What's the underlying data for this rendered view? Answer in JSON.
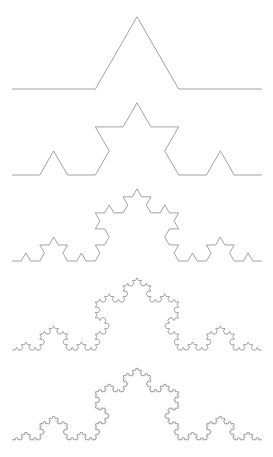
{
  "figure": {
    "background_color": "#ffffff",
    "width": 273,
    "height": 457
  },
  "chart_data": {
    "type": "line",
    "subtitle": "",
    "xlabel": "",
    "ylabel": "",
    "grid": false,
    "legend_position": "none",
    "xlim": [
      0,
      273
    ],
    "ylim": [
      457,
      0
    ],
    "axis_visible": false,
    "tick_labels_x": [],
    "tick_labels_y": [],
    "annotations": [],
    "geometry": {
      "start_x": 12,
      "end_x": 262,
      "span_width": 250,
      "peak_ratio": 0.2886751345948129
    },
    "series": [
      {
        "name": "Koch curve iteration 1",
        "order": 1,
        "depth": 1,
        "segments": 4,
        "baseline_y": 89,
        "peak_y": 17,
        "peak_x": 137,
        "stroke": "#8a8a8a",
        "stroke_width": 0.8
      },
      {
        "name": "Koch curve iteration 2",
        "order": 2,
        "depth": 2,
        "segments": 16,
        "baseline_y": 175,
        "peak_y": 103,
        "peak_x": 137,
        "stroke": "#8a8a8a",
        "stroke_width": 0.8
      },
      {
        "name": "Koch curve iteration 3",
        "order": 3,
        "depth": 3,
        "segments": 64,
        "baseline_y": 261,
        "peak_y": 189,
        "peak_x": 137,
        "stroke": "#8a8a8a",
        "stroke_width": 0.8
      },
      {
        "name": "Koch curve iteration 4",
        "order": 4,
        "depth": 4,
        "segments": 256,
        "baseline_y": 350,
        "peak_y": 278,
        "peak_x": 137,
        "stroke": "#8a8a8a",
        "stroke_width": 0.8
      },
      {
        "name": "Koch curve iteration 5",
        "order": 5,
        "depth": 5,
        "segments": 1024,
        "baseline_y": 440,
        "peak_y": 368,
        "peak_x": 137,
        "stroke": "#8a8a8a",
        "stroke_width": 0.8
      }
    ]
  }
}
